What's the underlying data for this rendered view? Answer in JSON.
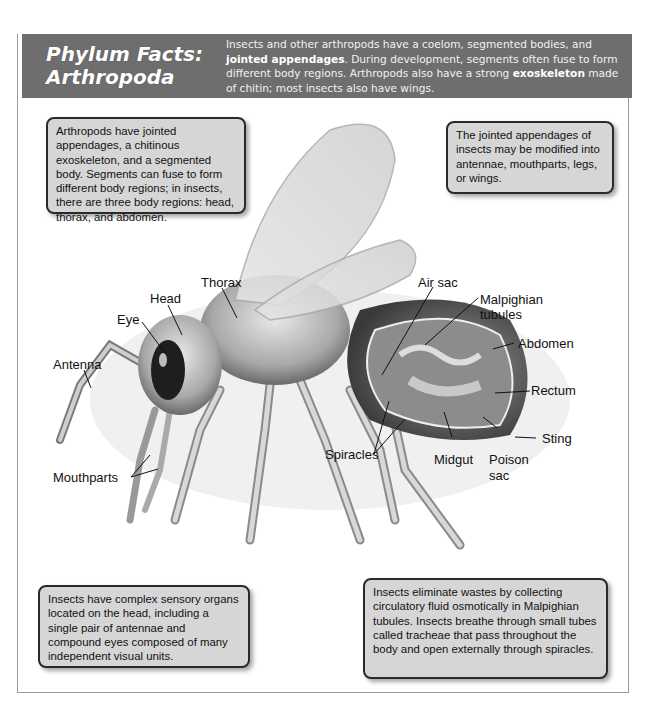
{
  "header": {
    "title_line1": "Phylum Facts:",
    "title_line2": "Arthropoda",
    "desc_part1": "Insects and other arthropods have a coelom, segmented bodies, and ",
    "desc_bold1": "jointed appendages",
    "desc_part2": ". During development, segments often fuse to form different body regions. Arthropods also have a strong ",
    "desc_bold2": "exoskeleton",
    "desc_part3": " made of chitin; most insects also have wings."
  },
  "boxes": {
    "top_left": "Arthropods have jointed appendages, a chitinous exoskeleton, and a segmented body. Segments can fuse to form different body regions; in insects, there are three body regions: head, thorax, and abdomen.",
    "top_right": "The jointed appendages of insects may be modified into antennae, mouthparts, legs, or wings.",
    "bottom_left": "Insects have complex sensory organs located on the head, including a single pair of antennae and compound eyes composed of many independent visual units.",
    "bottom_right": "Insects eliminate wastes by collecting circulatory fluid osmotically in Malpighian tubules. Insects breathe through small tubes called tracheae that pass throughout the body and open externally through spiracles."
  },
  "labels": {
    "head": "Head",
    "thorax": "Thorax",
    "eye": "Eye",
    "antenna": "Antenna",
    "mouthparts": "Mouthparts",
    "spiracles": "Spiracles",
    "air_sac": "Air sac",
    "malpighian_1": "Malpighian",
    "malpighian_2": "tubules",
    "abdomen": "Abdomen",
    "rectum": "Rectum",
    "sting": "Sting",
    "midgut": "Midgut",
    "poison_1": "Poison",
    "poison_2": "sac"
  },
  "colors": {
    "header_bg": "#6e6e6e",
    "box_bg": "#d6d6d6",
    "box_border": "#2a2a2a"
  }
}
